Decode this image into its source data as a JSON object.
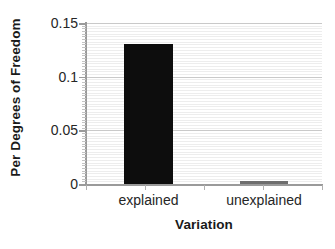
{
  "chart_data": {
    "type": "bar",
    "title": "",
    "subtitle": "",
    "xlabel": "Variation",
    "ylabel": "Per Degrees of Freedom",
    "categories": [
      "explained",
      "unexplained"
    ],
    "values": [
      0.1304,
      0.0025
    ],
    "series": [
      {
        "name": "Per Degrees of Freedom",
        "values": [
          0.1304,
          0.0025
        ],
        "colors": [
          "#0d0d0d",
          "#6e6e6e"
        ]
      }
    ],
    "ylim": [
      0,
      0.15
    ],
    "yticks": [
      0,
      0.05,
      0.1,
      0.15
    ],
    "ytick_labels": [
      "0",
      "0.05",
      "0.1",
      "0.15"
    ],
    "y_minor_tick_step": 0.0025,
    "grid": {
      "horizontal_minor": true,
      "horizontal_major": true,
      "vertical": false
    },
    "legend": {
      "visible": false,
      "position": "none"
    },
    "axis_colors": {
      "spine": "#9a9a9a",
      "gridline_minor": "#ededed",
      "gridline_major": "#c9c9c9",
      "text": "#262626",
      "title_text": "#1a1a1a"
    },
    "bar_colors": {
      "explained": "#0d0d0d",
      "unexplained": "#6e6e6e"
    }
  },
  "axes": {
    "y_title": "Per Degrees of Freedom",
    "x_title": "Variation",
    "y_labels": [
      "0.15",
      "0.1",
      "0.05",
      "0"
    ],
    "x_labels": [
      "explained",
      "unexplained"
    ]
  }
}
